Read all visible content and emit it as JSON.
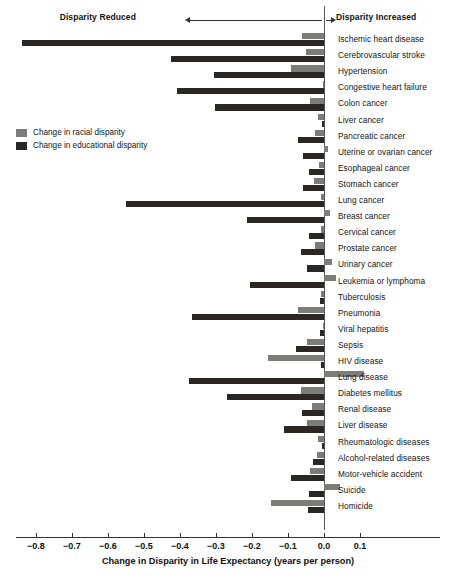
{
  "header": {
    "left_label": "Disparity Reduced",
    "right_label": "Disparity Increased",
    "left_arrow_icon": "arrow-left-icon",
    "right_arrow_icon": "arrow-right-icon"
  },
  "legend": {
    "items": [
      {
        "label": "Change in racial disparity",
        "color": "#7c7c78"
      },
      {
        "label": "Change in educational disparity",
        "color": "#2b2724"
      }
    ]
  },
  "axis": {
    "title": "Change in Disparity in Life Expectancy (years per person)",
    "ticks": [
      "−0.8",
      "−0.7",
      "−0.6",
      "−0.5",
      "−0.4",
      "−0.3",
      "−0.2",
      "−0.1",
      "0.0",
      "0.1"
    ],
    "tick_values": [
      -0.8,
      -0.7,
      -0.6,
      -0.5,
      -0.4,
      -0.3,
      -0.2,
      -0.1,
      0.0,
      0.1
    ]
  },
  "chart_data": {
    "type": "bar",
    "orientation": "horizontal",
    "title": "",
    "subtitle": "",
    "xlabel": "Change in Disparity in Life Expectancy (years per person)",
    "ylabel": "",
    "xlim": [
      -0.85,
      0.13
    ],
    "grid": false,
    "legend_position": "upper-left-inside",
    "zero_reference_line": 0.0,
    "annotations": [
      "Disparity Reduced",
      "Disparity Increased"
    ],
    "categories": [
      "Ischemic heart disease",
      "Cerebrovascular stroke",
      "Hypertension",
      "Congestive heart failure",
      "Colon cancer",
      "Liver cancer",
      "Pancreatic cancer",
      "Uterine or ovarian cancer",
      "Esophageal cancer",
      "Stomach cancer",
      "Lung cancer",
      "Breast cancer",
      "Cervical cancer",
      "Prostate cancer",
      "Urinary cancer",
      "Leukemia or lymphoma",
      "Tuberculosis",
      "Pneumonia",
      "Viral hepatitis",
      "Sepsis",
      "HIV disease",
      "Lung disease",
      "Diabetes mellitus",
      "Renal disease",
      "Liver disease",
      "Rheumatologic diseases",
      "Alcohol-related diseases",
      "Motor-vehicle accident",
      "Suicide",
      "Homicide"
    ],
    "series": [
      {
        "name": "Change in racial disparity",
        "color": "#7c7c78",
        "values": [
          -0.062,
          -0.05,
          -0.092,
          -0.004,
          -0.039,
          -0.018,
          -0.026,
          0.012,
          -0.015,
          -0.028,
          -0.008,
          0.016,
          -0.009,
          -0.024,
          0.023,
          0.032,
          -0.007,
          -0.073,
          -0.004,
          -0.047,
          -0.156,
          0.11,
          -0.063,
          -0.032,
          -0.048,
          -0.017,
          -0.02,
          -0.038,
          0.044,
          -0.148
        ]
      },
      {
        "name": "Change in educational disparity",
        "color": "#2b2724",
        "values": [
          -0.84,
          -0.425,
          -0.305,
          -0.407,
          -0.303,
          -0.006,
          -0.073,
          -0.058,
          -0.043,
          -0.059,
          -0.55,
          -0.215,
          -0.042,
          -0.063,
          -0.046,
          -0.205,
          -0.01,
          -0.368,
          -0.012,
          -0.078,
          -0.008,
          -0.375,
          -0.27,
          -0.06,
          -0.11,
          -0.005,
          -0.031,
          -0.093,
          -0.042,
          -0.044
        ]
      }
    ]
  }
}
